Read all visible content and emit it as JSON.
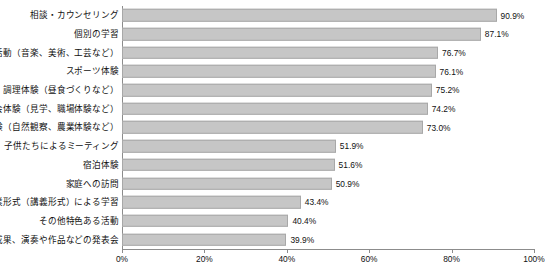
{
  "chart_data": {
    "type": "bar",
    "orientation": "horizontal",
    "title": "",
    "xlabel": "",
    "ylabel": "",
    "xlim": [
      0,
      100
    ],
    "grid": false,
    "legend": "none",
    "xticks": [
      "0%",
      "20%",
      "40%",
      "60%",
      "80%",
      "100%"
    ],
    "xtick_values": [
      0,
      20,
      40,
      60,
      80,
      100
    ],
    "categories": [
      "相談・カウンセリング",
      "個別の学習",
      "芸術活動（音楽、美術、工芸など）",
      "スポーツ体験",
      "調理体験（昼食づくりなど）",
      "社会体験（見学、職場体験など）",
      "自然体験（自然観察、農業体験など）",
      "子供たちによるミーティング",
      "宿泊体験",
      "家庭への訪問",
      "授業形式（講義形式）による学習",
      "その他特色ある活動",
      "学習成果、演奏や作品などの発表会"
    ],
    "values": [
      90.9,
      87.1,
      76.7,
      76.1,
      75.2,
      74.2,
      73.0,
      51.9,
      51.6,
      50.9,
      43.4,
      40.4,
      39.9
    ],
    "value_labels": [
      "90.9%",
      "87.1%",
      "76.7%",
      "76.1%",
      "75.2%",
      "74.2%",
      "73.0%",
      "51.9%",
      "51.6%",
      "50.9%",
      "43.4%",
      "40.4%",
      "39.9%"
    ],
    "bar_color": "#c6c6c6",
    "bar_border_color": "#a8a8a8",
    "axis_color": "#8c8c8c",
    "text_color": "#111111"
  }
}
